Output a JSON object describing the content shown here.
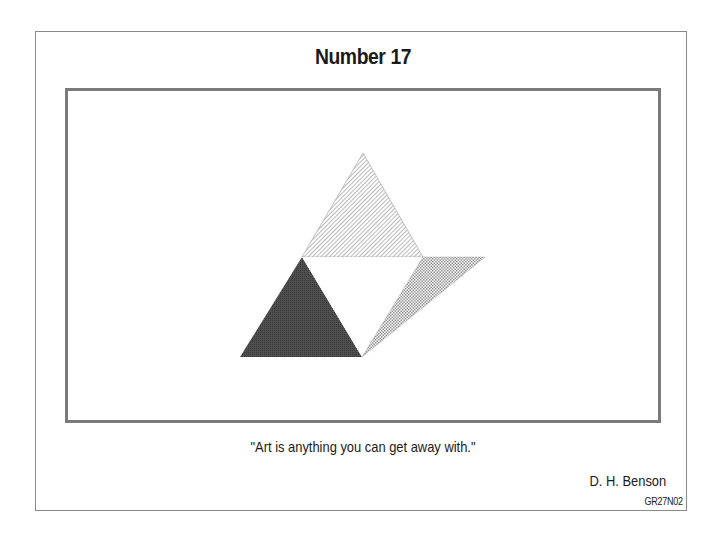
{
  "slide": {
    "title": "Number 17",
    "quote": "\"Art is anything you can get away with.\"",
    "author": "D. H. Benson",
    "code": "GR27N02"
  },
  "artwork": {
    "shapes": [
      {
        "name": "top-triangle",
        "fill": "diagonal-hatch",
        "color": "#8a8a8a"
      },
      {
        "name": "left-triangle",
        "fill": "dark-solid",
        "color": "#4a4a4a"
      },
      {
        "name": "center-triangle",
        "fill": "white",
        "color": "#ffffff"
      },
      {
        "name": "right-triangle",
        "fill": "crosshatch",
        "color": "#9a9a9a"
      }
    ]
  },
  "colors": {
    "frame": "#7a7a7a",
    "outer_border": "#8a8a8a"
  }
}
